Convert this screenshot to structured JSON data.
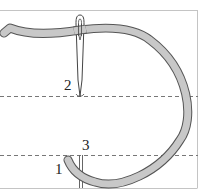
{
  "diagram": {
    "labels": {
      "one": "1",
      "two": "2",
      "three": "3"
    },
    "colors": {
      "thread_fill": "#c8c8c8",
      "thread_outline": "#555555",
      "frame": "#bbbbbb",
      "guide_dash": "#777777"
    }
  }
}
